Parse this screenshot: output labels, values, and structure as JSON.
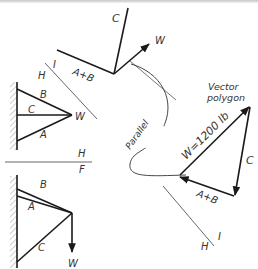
{
  "figure": {
    "top_vectors": {
      "labels": {
        "c": "C",
        "w": "W",
        "a_plus_b": "A+B",
        "i": "I",
        "h": "H"
      }
    },
    "bracket_1": {
      "labels": {
        "b": "B",
        "c": "C",
        "a": "A",
        "w": "W"
      }
    },
    "divider": {
      "labels": {
        "h": "H",
        "f": "F"
      }
    },
    "bracket_2": {
      "labels": {
        "b": "B",
        "a": "A",
        "c": "C",
        "w": "W"
      }
    },
    "parallel_annotation": {
      "label": "Parallel"
    },
    "vector_polygon": {
      "title_line1": "Vector",
      "title_line2": "polygon",
      "w_label": "W=1200  lb",
      "c_label": "C",
      "a_plus_b_label": "A+B",
      "i_label": "I",
      "h_label": "H"
    }
  },
  "colors": {
    "line": "#1a1a1a",
    "thin_line": "#555555",
    "hatch": "#9a9a9a"
  }
}
